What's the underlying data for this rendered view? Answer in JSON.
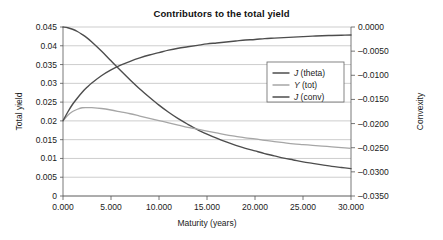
{
  "chart_data": {
    "type": "line",
    "title": "Contributors to the total yield",
    "xlabel": "Maturity (years)",
    "ylabel": "Total yield",
    "y2label": "Convexity",
    "xlim": [
      0,
      30
    ],
    "ylim": [
      0,
      0.045
    ],
    "y2lim": [
      -0.035,
      0.0
    ],
    "grid": true,
    "legend_position": "upper-right",
    "xticks": [
      0,
      5,
      10,
      15,
      20,
      25,
      30
    ],
    "xtick_labels": [
      "0.000",
      "5.000",
      "10.000",
      "15.000",
      "20.000",
      "25.000",
      "30.000"
    ],
    "yticks": [
      0,
      0.005,
      0.01,
      0.015,
      0.02,
      0.025,
      0.03,
      0.035,
      0.04,
      0.045
    ],
    "ytick_labels": [
      "0",
      "0.005",
      "0.01",
      "0.015",
      "0.02",
      "0.025",
      "0.03",
      "0.035",
      "0.04",
      "0.045"
    ],
    "y2ticks": [
      -0.035,
      -0.03,
      -0.025,
      -0.02,
      -0.015,
      -0.01,
      -0.005,
      0.0
    ],
    "y2tick_labels": [
      "–0.0350",
      "–0.0300",
      "–0.0250",
      "–0.0200",
      "–0.0150",
      "–0.0100",
      "–0.0050",
      "0.0000"
    ],
    "x": [
      0,
      0.5,
      1,
      1.5,
      2,
      2.5,
      3,
      4,
      5,
      6,
      7,
      8,
      9,
      10,
      11,
      12,
      13,
      14,
      15,
      16,
      17,
      18,
      19,
      20,
      21,
      22,
      23,
      24,
      25,
      26,
      27,
      28,
      29,
      30
    ],
    "series": [
      {
        "name": "J (theta)",
        "name_italic_prefix": "J",
        "name_rest": " (theta)",
        "axis": "left",
        "color": "#4d4d4d",
        "width": 1.4,
        "values": [
          0.045,
          0.0448,
          0.0444,
          0.0438,
          0.043,
          0.0421,
          0.041,
          0.0386,
          0.036,
          0.0334,
          0.0309,
          0.0285,
          0.0263,
          0.0242,
          0.0223,
          0.0206,
          0.0191,
          0.0177,
          0.0165,
          0.0154,
          0.0144,
          0.0135,
          0.0127,
          0.012,
          0.0113,
          0.0107,
          0.0101,
          0.0096,
          0.0091,
          0.0087,
          0.0083,
          0.0079,
          0.0076,
          0.0073
        ]
      },
      {
        "name": "Y (tot)",
        "name_italic_prefix": "Y",
        "name_rest": " (tot)",
        "axis": "left",
        "color": "#a6a6a6",
        "width": 1.3,
        "values": [
          0.02,
          0.0215,
          0.0225,
          0.0231,
          0.0235,
          0.02355,
          0.02352,
          0.0233,
          0.0229,
          0.0224,
          0.0219,
          0.0213,
          0.0207,
          0.0201,
          0.0195,
          0.0189,
          0.0183,
          0.0178,
          0.0173,
          0.0168,
          0.0163,
          0.0159,
          0.0155,
          0.0152,
          0.0148,
          0.0145,
          0.0142,
          0.0139,
          0.0137,
          0.0135,
          0.0133,
          0.0131,
          0.0129,
          0.0127
        ]
      },
      {
        "name": "J (conv)",
        "name_italic_prefix": "J",
        "name_rest": " (conv)",
        "axis": "right",
        "color": "#4d4d4d",
        "width": 1.4,
        "values": [
          -0.0194,
          -0.0176,
          -0.016,
          -0.0147,
          -0.0135,
          -0.0125,
          -0.0116,
          -0.0101,
          -0.0089,
          -0.0079,
          -0.0071,
          -0.0064,
          -0.0058,
          -0.0053,
          -0.0048,
          -0.0044,
          -0.0041,
          -0.0038,
          -0.0035,
          -0.0033,
          -0.0031,
          -0.0029,
          -0.0027,
          -0.0026,
          -0.0024,
          -0.0023,
          -0.0022,
          -0.0021,
          -0.002,
          -0.0019,
          -0.0018,
          -0.00175,
          -0.0017,
          -0.00165
        ]
      }
    ]
  },
  "legend": {
    "items": [
      {
        "label": "J (theta)"
      },
      {
        "label": "Y (tot)"
      },
      {
        "label": "J (conv)"
      }
    ]
  }
}
